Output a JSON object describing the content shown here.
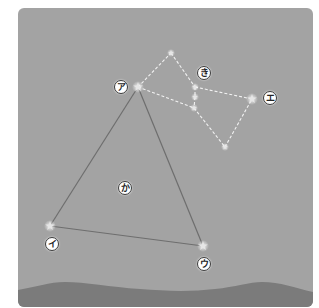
{
  "diagram": {
    "type": "constellation-diagram",
    "colors": {
      "sky": "#a3a3a3",
      "ground": "#7b7b7b",
      "triangle_line": "#6e6e6e",
      "dashed_line": "#f2f2f2",
      "star": "#e6e6e6",
      "label_bg": "#ffffff",
      "label_border": "#3a3a3a"
    },
    "labels": {
      "a": "ア",
      "i": "イ",
      "u": "ウ",
      "e": "エ",
      "ka": "か",
      "ki": "き"
    },
    "stars": [
      {
        "id": "a",
        "x": 138,
        "y": 87
      },
      {
        "id": "i",
        "x": 50,
        "y": 226
      },
      {
        "id": "u",
        "x": 203,
        "y": 246
      },
      {
        "id": "e",
        "x": 252,
        "y": 99
      },
      {
        "id": "top",
        "x": 171,
        "y": 53
      },
      {
        "id": "mid1",
        "x": 195,
        "y": 87
      },
      {
        "id": "mid2",
        "x": 195,
        "y": 97
      },
      {
        "id": "mid3",
        "x": 194,
        "y": 108
      },
      {
        "id": "bottom",
        "x": 225,
        "y": 147
      }
    ],
    "triangle": {
      "vertices": [
        "a",
        "i",
        "u"
      ],
      "interior_label": "ka"
    },
    "dashed_figure": {
      "label": "ki",
      "path": [
        "a",
        "top",
        "mid1",
        "mid2",
        "mid3",
        "bottom",
        "e",
        "mid1"
      ],
      "extra_segments": [
        [
          "a",
          "mid3"
        ]
      ]
    }
  }
}
